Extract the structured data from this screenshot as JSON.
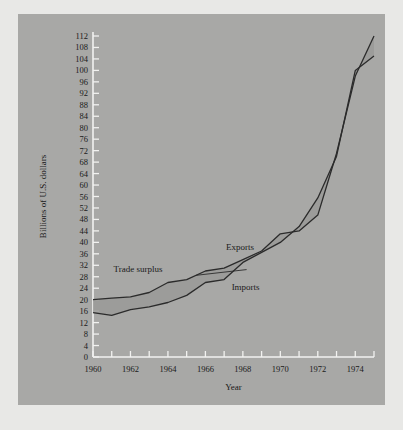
{
  "chart_data": {
    "type": "line",
    "title": "",
    "xlabel": "Year",
    "ylabel": "Billions of U.S. dollars",
    "xlim": [
      1960,
      1975
    ],
    "ylim": [
      0,
      112
    ],
    "ytick_step": 4,
    "xtick_step": 1,
    "xtick_label_step": 2,
    "grid": false,
    "legend": "inline-annotations",
    "x": [
      1960,
      1961,
      1962,
      1963,
      1964,
      1965,
      1966,
      1967,
      1968,
      1969,
      1970,
      1971,
      1972,
      1973,
      1974,
      1975
    ],
    "series": [
      {
        "name": "Exports",
        "values": [
          20.0,
          20.5,
          21.0,
          22.5,
          26.0,
          27.0,
          30.0,
          31.0,
          34.0,
          37.0,
          43.0,
          44.0,
          49.5,
          71.0,
          98.0,
          112.0
        ]
      },
      {
        "name": "Imports",
        "values": [
          15.5,
          14.5,
          16.5,
          17.5,
          19.0,
          21.5,
          26.0,
          27.0,
          33.0,
          36.5,
          40.0,
          45.5,
          55.5,
          70.0,
          100.0,
          105.0
        ]
      }
    ],
    "ytick_labels": [
      "0",
      "4",
      "8",
      "12",
      "16",
      "20",
      "24",
      "28",
      "32",
      "36",
      "40",
      "44",
      "48",
      "52",
      "56",
      "60",
      "64",
      "68",
      "72",
      "76",
      "80",
      "84",
      "88",
      "92",
      "96",
      "100",
      "104",
      "108",
      "112"
    ],
    "xtick_labels": [
      "1960",
      "1962",
      "1964",
      "1966",
      "1968",
      "1970",
      "1972",
      "1974"
    ],
    "annotations": [
      {
        "name": "exports-label",
        "text": "Exports"
      },
      {
        "name": "imports-label",
        "text": "Imports"
      },
      {
        "name": "trade-surplus-label",
        "text": "Trade surplus"
      }
    ],
    "colors": {
      "panel": "#a8a8a6",
      "page": "#e8e8e6",
      "line": "#2b2b2b",
      "band": "#9a9a98",
      "axis": "#f2f2f0",
      "text": "#1a1a1a"
    }
  }
}
